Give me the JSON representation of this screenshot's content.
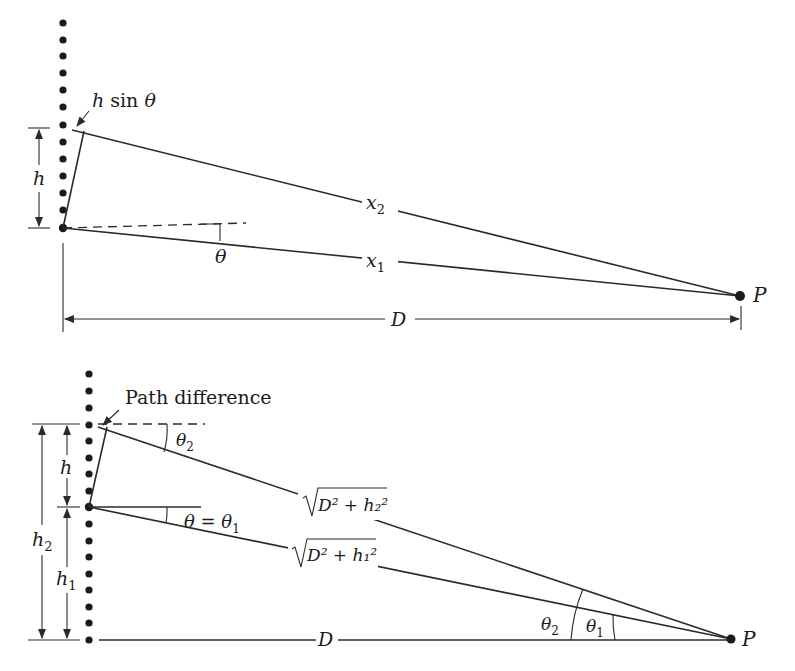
{
  "figure": {
    "top_diagram": {
      "labels": {
        "h_sin_theta": "h sin θ",
        "h": "h",
        "theta": "θ",
        "x2": "x",
        "x2_sub": "2",
        "x1": "x",
        "x1_sub": "1",
        "D": "D",
        "P": "P"
      }
    },
    "bottom_diagram": {
      "labels": {
        "path_difference": "Path difference",
        "h": "h",
        "h1": "h",
        "h1_sub": "1",
        "h2": "h",
        "h2_sub": "2",
        "theta2_top": "θ",
        "theta2_top_sub": "2",
        "theta_eq_theta1": "θ = θ",
        "theta_eq_theta1_sub": "1",
        "sqrt_D2_h2": "D² + h₂²",
        "sqrt_D2_h1": "D² + h₁²",
        "theta2_at_P": "θ",
        "theta2_at_P_sub": "2",
        "theta1_at_P": "θ",
        "theta1_at_P_sub": "1",
        "D": "D",
        "P": "P"
      }
    }
  }
}
